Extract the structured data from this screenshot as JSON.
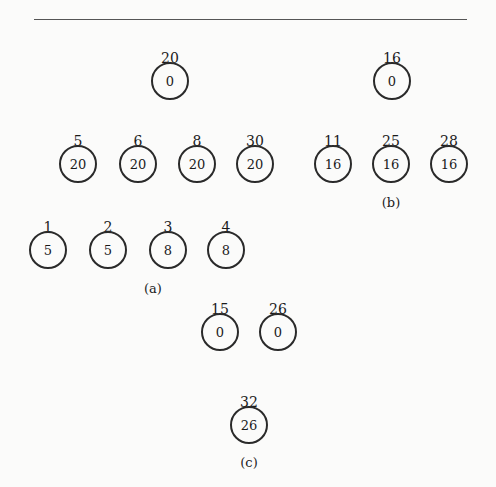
{
  "figure": {
    "rule": "horizontal-rule",
    "parts": {
      "a": {
        "caption": "(a)",
        "nodes": [
          {
            "label": "1",
            "value": "5"
          },
          {
            "label": "2",
            "value": "5"
          },
          {
            "label": "3",
            "value": "8"
          },
          {
            "label": "4",
            "value": "8"
          }
        ]
      },
      "b": {
        "caption": "(b)",
        "roots": [
          {
            "label": "20",
            "value": "0"
          },
          {
            "label": "16",
            "value": "0"
          }
        ],
        "children_20": [
          {
            "label": "5",
            "value": "20"
          },
          {
            "label": "6",
            "value": "20"
          },
          {
            "label": "8",
            "value": "20"
          },
          {
            "label": "30",
            "value": "20"
          }
        ],
        "children_16": [
          {
            "label": "11",
            "value": "16"
          },
          {
            "label": "25",
            "value": "16"
          },
          {
            "label": "28",
            "value": "16"
          }
        ]
      },
      "c": {
        "caption": "(c)",
        "nodes": [
          {
            "label": "15",
            "value": "0"
          },
          {
            "label": "26",
            "value": "0"
          },
          {
            "label": "32",
            "value": "26"
          }
        ]
      }
    }
  }
}
